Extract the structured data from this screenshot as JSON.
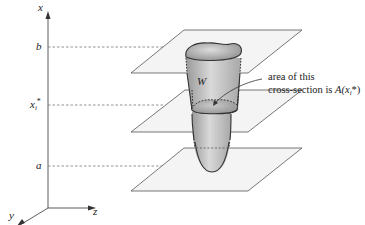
{
  "figure": {
    "axes": {
      "x_label": "x",
      "y_label": "y",
      "z_label": "z"
    },
    "levels": {
      "b": "b",
      "xi_star": "x",
      "xi_star_sub": "i",
      "xi_star_sup": "*",
      "a": "a"
    },
    "solid_label": "W",
    "annotation": {
      "line1": "area of this",
      "line2_prefix": "cross-section is ",
      "line2_func": "A(x",
      "line2_sub": "i",
      "line2_suffix": "*)"
    },
    "colors": {
      "plane_fill": "#f4f4f4",
      "plane_stroke": "#555555",
      "solid_dark": "#8a8a8a",
      "solid_light": "#d6d6d6",
      "axis": "#333333",
      "dashed": "#777777"
    }
  }
}
